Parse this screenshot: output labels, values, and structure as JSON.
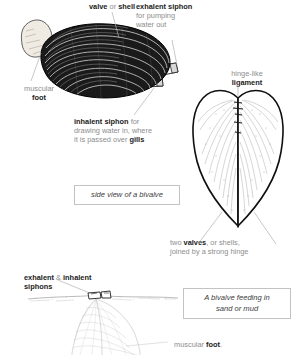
{
  "diagram": {
    "colors": {
      "label_grey": "#8d8d8d",
      "label_bold": "#1b1b1b",
      "leader_line": "#b0b0b0",
      "caption_border": "#c3c3c3",
      "shell_dark": "#1a1a1a",
      "foot_pale": "#efeae0",
      "background": "#ffffff"
    },
    "labels": {
      "valve_or_shell": {
        "bold1": "valve",
        "plain": " or ",
        "bold2": "shell"
      },
      "exhalent_siphon": {
        "bold": "exhalent siphon",
        "line2": "for pumping",
        "line3": "water out"
      },
      "muscular_foot": {
        "plain": "muscular",
        "bold": "foot"
      },
      "inhalent_siphon": {
        "bold": "inhalent siphon",
        "plain1": " for",
        "line2": "drawing water in, where",
        "line3_plain": "it is passed over ",
        "line3_bold": "gills"
      },
      "hinge_like_ligament": {
        "plain": "hinge-like",
        "bold": "ligament"
      },
      "two_valves": {
        "plain1": "two ",
        "bold": "valves",
        "plain2": ", or shells,",
        "line2": "joined by a strong hinge"
      },
      "exhalent_inhalent_siphons": {
        "bold1": "exhalent",
        "amp": " & ",
        "bold2": "inhalent",
        "line2": "siphons"
      },
      "muscular_foot_bottom": {
        "plain": "muscular ",
        "bold": "foot",
        "period": "."
      }
    },
    "captions": {
      "side_view": "side view of a bivalve",
      "feeding": {
        "line1": "A bivalve feeding in",
        "line2": "sand or mud"
      }
    },
    "illustrations": {
      "mussel_side": "mussel-side-view-illustration",
      "valves_top": "two-valves-top-view-illustration",
      "buried_bivalve": "buried-bivalve-in-sand-illustration"
    }
  }
}
